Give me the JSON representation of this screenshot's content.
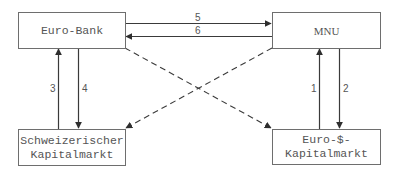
{
  "diagram": {
    "nodes": {
      "euro_bank": {
        "label": "Euro-Bank"
      },
      "mnu": {
        "label": "MNU"
      },
      "schweiz_kapitalmarkt": {
        "label": "Schweizerischer\nKapitalmarkt"
      },
      "euro_dollar_kapitalmarkt": {
        "label": "Euro-$-\nKapitalmarkt"
      }
    },
    "edges": [
      {
        "id": "1",
        "label": "1",
        "from": "Euro-$-Kapitalmarkt",
        "to": "MNU",
        "style": "solid"
      },
      {
        "id": "2",
        "label": "2",
        "from": "MNU",
        "to": "Euro-$-Kapitalmarkt",
        "style": "solid"
      },
      {
        "id": "3",
        "label": "3",
        "from": "Schweizerischer Kapitalmarkt",
        "to": "Euro-Bank",
        "style": "solid"
      },
      {
        "id": "4",
        "label": "4",
        "from": "Euro-Bank",
        "to": "Schweizerischer Kapitalmarkt",
        "style": "solid"
      },
      {
        "id": "5",
        "label": "5",
        "from": "Euro-Bank",
        "to": "MNU",
        "style": "solid"
      },
      {
        "id": "6",
        "label": "6",
        "from": "MNU",
        "to": "Euro-Bank",
        "style": "solid"
      },
      {
        "id": "d1",
        "label": "",
        "from": "Euro-Bank",
        "to": "Euro-$-Kapitalmarkt",
        "style": "dashed"
      },
      {
        "id": "d2",
        "label": "",
        "from": "MNU",
        "to": "Schweizerischer Kapitalmarkt",
        "style": "dashed"
      }
    ],
    "colors": {
      "line": "#3a3a3a",
      "border": "#6e6e6e",
      "text": "#555555"
    }
  }
}
